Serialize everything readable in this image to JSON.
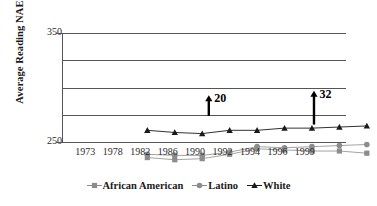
{
  "chart_data": {
    "type": "line",
    "title": "",
    "xlabel": "",
    "ylabel": "Average Reading NAEP Score",
    "categories": [
      "1973",
      "1978",
      "1982",
      "1986",
      "1990",
      "1992",
      "1994",
      "1996",
      "1999"
    ],
    "ylim": [
      250,
      350
    ],
    "yticks": [
      250,
      350
    ],
    "ytick_labels": [
      "250",
      "350"
    ],
    "gridlines": [
      250,
      275,
      300,
      325,
      350
    ],
    "grid": true,
    "legend_position": "bottom",
    "series": [
      {
        "name": "African American",
        "marker": "square",
        "color": "#8c8c8c",
        "values": [
          266,
          264,
          265,
          269,
          274,
          273,
          272,
          272,
          270
        ]
      },
      {
        "name": "Latino",
        "marker": "circle",
        "color": "#8c8c8c",
        "values": [
          269,
          268,
          268,
          271,
          276,
          275,
          276,
          277,
          278
        ]
      },
      {
        "name": "White",
        "marker": "triangle",
        "color": "#1a1a1a",
        "values": [
          291,
          289,
          288,
          291,
          291,
          293,
          293,
          294,
          295
        ]
      }
    ],
    "annotations": [
      {
        "id": "gap-1991",
        "label": "20",
        "x_position": 1991,
        "from_value": 274,
        "to_value": 293
      },
      {
        "id": "gap-2000",
        "label": "32",
        "x_position": 2000,
        "from_value": 266,
        "to_value": 297
      }
    ]
  },
  "legend": {
    "items": [
      {
        "label": "African American",
        "marker": "square-marker"
      },
      {
        "label": "Latino",
        "marker": "circle-marker"
      },
      {
        "label": "White",
        "marker": "triangle-marker"
      }
    ]
  }
}
